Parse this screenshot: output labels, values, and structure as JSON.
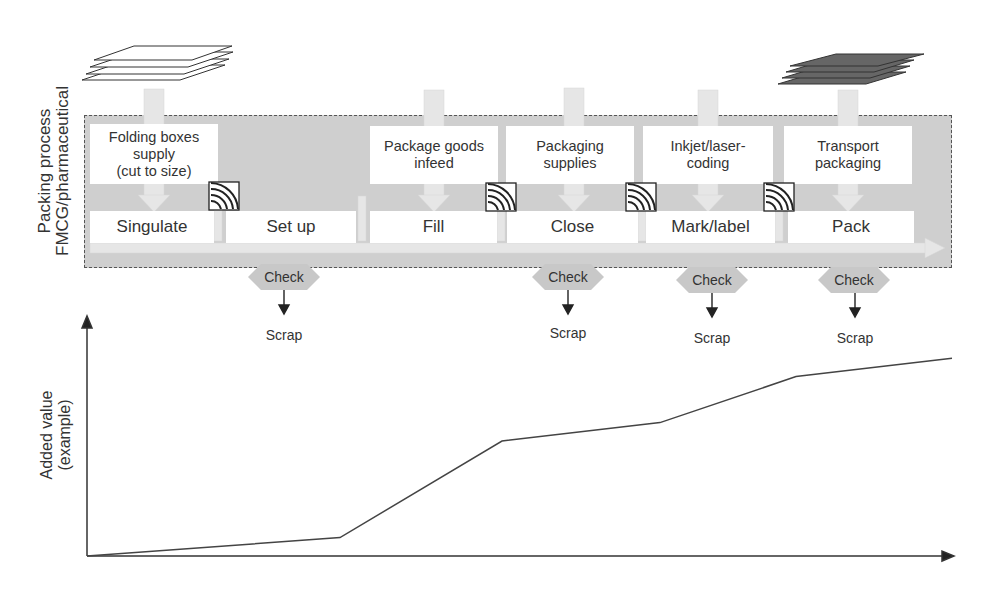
{
  "process_label": {
    "line1": "Packing process",
    "line2": "FMCG/pharmaceutical"
  },
  "supplies": [
    {
      "id": "folding",
      "lines": [
        "Folding boxes",
        "supply",
        "(cut to size)"
      ]
    },
    {
      "id": "goods",
      "lines": [
        "Package goods",
        "infeed"
      ]
    },
    {
      "id": "packaging",
      "lines": [
        "Packaging",
        "supplies"
      ]
    },
    {
      "id": "coding",
      "lines": [
        "Inkjet/laser-",
        "coding"
      ]
    },
    {
      "id": "transport",
      "lines": [
        "Transport",
        "packaging"
      ]
    }
  ],
  "steps": [
    "Singulate",
    "Set up",
    "Fill",
    "Close",
    "Mark/label",
    "Pack"
  ],
  "check_label": "Check",
  "scrap_label": "Scrap",
  "icons": {
    "stack_white": "paper-stack-icon",
    "stack_dark": "dark-paper-stack-icon",
    "sensor": "sensor-wave-icon"
  },
  "colors": {
    "band": "#cfcfcf",
    "box": "#ffffff",
    "line": "#333333",
    "dark_stack": "#666666"
  },
  "chart_data": {
    "type": "line",
    "title": "",
    "xlabel": "",
    "ylabel": "Added value (example)",
    "ylabel_lines": [
      "Added value",
      "(example)"
    ],
    "categories": [
      "Start",
      "Singulate/Set up",
      "Fill",
      "Close",
      "Mark/label",
      "Pack"
    ],
    "values": [
      0,
      8,
      50,
      58,
      78,
      86
    ],
    "ylim": [
      0,
      100
    ],
    "grid": false,
    "legend": "none"
  }
}
